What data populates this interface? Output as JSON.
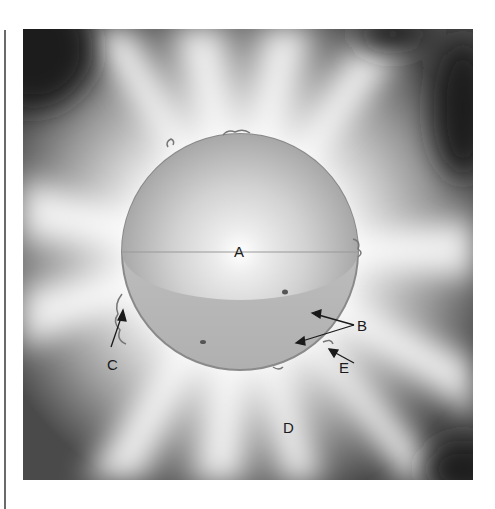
{
  "diagram": {
    "colors": {
      "background": "#ffffff",
      "frame_dark": "#2e2e2e",
      "corona_light": "#f2f2f2",
      "sphere_surface": "#b4b4b4",
      "interior_light": "#e8e8e8",
      "interior_dark": "#9a9a9a",
      "label_text": "#1a1a1a"
    },
    "labels": [
      {
        "id": "A",
        "text": "A",
        "x": 235,
        "y": 244
      },
      {
        "id": "B",
        "text": "B",
        "x": 360,
        "y": 320
      },
      {
        "id": "C",
        "text": "C",
        "x": 108,
        "y": 357
      },
      {
        "id": "D",
        "text": "D",
        "x": 284,
        "y": 420
      },
      {
        "id": "E",
        "text": "E",
        "x": 340,
        "y": 360
      }
    ]
  }
}
